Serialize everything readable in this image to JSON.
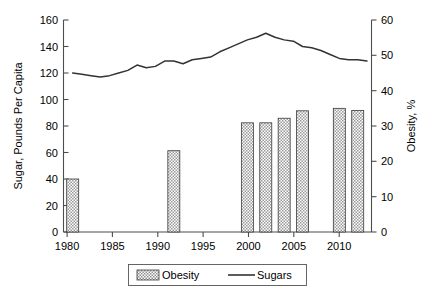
{
  "chart_data": {
    "type": "bar",
    "title": "",
    "subtitle": "",
    "xlabel": "",
    "ylabel": "Sugar, Pounds Per Capita",
    "y2label": "Obesity, %",
    "xlim": [
      1979,
      2012.5
    ],
    "ylim": [
      0,
      160
    ],
    "y2lim": [
      0,
      60
    ],
    "grid": false,
    "legend_position": "bottom-center",
    "x_ticks": [
      1980,
      1985,
      1990,
      1995,
      2000,
      2005,
      2010
    ],
    "x_tick_labels": [
      "1980",
      "1985",
      "1990",
      "1995",
      "2000",
      "2005",
      "2010"
    ],
    "y_ticks": [
      0,
      20,
      40,
      60,
      80,
      100,
      120,
      140,
      160
    ],
    "y_tick_labels": [
      "0",
      "20",
      "40",
      "60",
      "80",
      "100",
      "120",
      "140",
      "160"
    ],
    "y2_ticks": [
      0,
      10,
      20,
      30,
      40,
      50,
      60
    ],
    "y2_tick_labels": [
      "0",
      "10",
      "20",
      "30",
      "40",
      "50",
      "60"
    ],
    "series": [
      {
        "name": "Obesity",
        "type": "bar",
        "axis": "right",
        "unit": "%",
        "x": [
          1980,
          1991,
          1999,
          2001,
          2003,
          2005,
          2009,
          2011
        ],
        "values": [
          15.0,
          23.0,
          30.9,
          30.9,
          32.2,
          34.3,
          35.0,
          34.4
        ]
      },
      {
        "name": "Sugars",
        "type": "line",
        "axis": "left",
        "unit": "Pounds Per Capita",
        "x": [
          1980,
          1981,
          1982,
          1983,
          1984,
          1985,
          1986,
          1987,
          1988,
          1989,
          1990,
          1991,
          1992,
          1993,
          1994,
          1995,
          1996,
          1997,
          1998,
          1999,
          2000,
          2001,
          2002,
          2003,
          2004,
          2005,
          2006,
          2007,
          2008,
          2009,
          2010,
          2011,
          2012
        ],
        "values": [
          120,
          119,
          118,
          117,
          118,
          120,
          122,
          126,
          124,
          125,
          129,
          129,
          127,
          130,
          131,
          132,
          136,
          139,
          142,
          145,
          147,
          150,
          147,
          145,
          144,
          140,
          139,
          137,
          134,
          131,
          130,
          130,
          129
        ]
      }
    ],
    "legend": [
      {
        "label": "Obesity",
        "marker": "patterned-swatch"
      },
      {
        "label": "Sugars",
        "marker": "line-swatch"
      }
    ]
  },
  "colors": {
    "bar_fill": "#cfcfcf",
    "bar_edge": "#3a3a3a",
    "line": "#333333",
    "axis": "#4d4d4d",
    "text": "#000000",
    "background": "#ffffff"
  }
}
